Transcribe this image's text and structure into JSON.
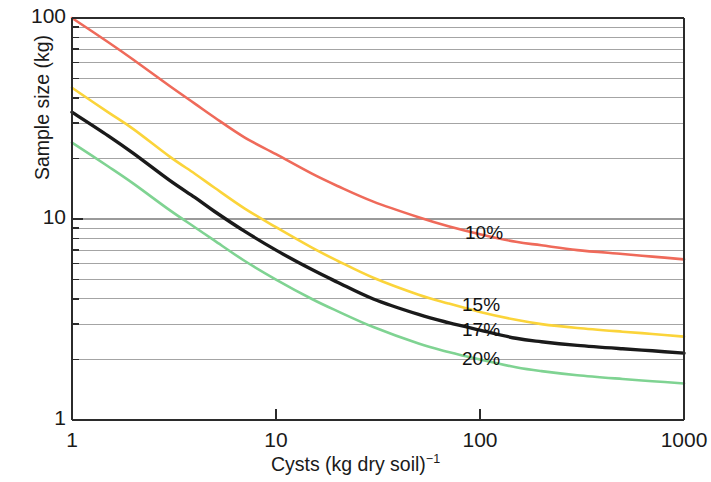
{
  "chart_data": {
    "type": "line",
    "title": "",
    "xlabel": "Cysts (kg dry soil)−1",
    "xlabel_base": "Cysts (kg dry soil)",
    "xlabel_exponent": "−1",
    "ylabel": "Sample size (kg)",
    "xscale": "log",
    "yscale": "log",
    "xlim": [
      1,
      1000
    ],
    "ylim": [
      1,
      100
    ],
    "xticks": [
      "1",
      "10",
      "100",
      "1000"
    ],
    "xtick_values": [
      1,
      10,
      100,
      1000
    ],
    "yticks": [
      "1",
      "10",
      "100"
    ],
    "ytick_values": [
      1,
      10,
      100
    ],
    "grid": "horizontal-minor-log",
    "legend_position": "inline-right",
    "series": [
      {
        "name": "10%",
        "color": "#ef6a5a",
        "width": 2.6,
        "label_x": 465,
        "label_y": 222,
        "x": [
          1,
          1.5,
          2,
          3,
          4,
          5,
          7,
          10,
          15,
          20,
          30,
          50,
          70,
          100,
          150,
          200,
          300,
          500,
          700,
          1000
        ],
        "y": [
          100,
          76,
          62,
          46,
          37.5,
          32,
          25.5,
          21,
          16.8,
          14.6,
          12.2,
          10.2,
          9.2,
          8.4,
          7.7,
          7.4,
          7.0,
          6.7,
          6.5,
          6.3
        ]
      },
      {
        "name": "15%",
        "color": "#fbd43a",
        "width": 2.6,
        "label_x": 462,
        "label_y": 294,
        "x": [
          1,
          1.5,
          2,
          3,
          4,
          5,
          7,
          10,
          15,
          20,
          30,
          50,
          70,
          100,
          150,
          200,
          300,
          500,
          700,
          1000
        ],
        "y": [
          45,
          34,
          28,
          20.5,
          16.8,
          14.3,
          11.3,
          9.1,
          7.2,
          6.2,
          5.1,
          4.2,
          3.8,
          3.45,
          3.15,
          3.0,
          2.87,
          2.75,
          2.68,
          2.6
        ]
      },
      {
        "name": "17%",
        "color": "#1a1a1a",
        "width": 3.4,
        "label_x": 462,
        "label_y": 319,
        "x": [
          1,
          1.5,
          2,
          3,
          4,
          5,
          7,
          10,
          15,
          20,
          30,
          50,
          70,
          100,
          150,
          200,
          300,
          500,
          700,
          1000
        ],
        "y": [
          34,
          26,
          21.2,
          15.6,
          12.8,
          10.9,
          8.7,
          7.0,
          5.6,
          4.85,
          4.0,
          3.35,
          3.05,
          2.8,
          2.55,
          2.45,
          2.35,
          2.26,
          2.21,
          2.15
        ]
      },
      {
        "name": "20%",
        "color": "#7fd392",
        "width": 2.6,
        "label_x": 462,
        "label_y": 348,
        "x": [
          1,
          1.5,
          2,
          3,
          4,
          5,
          7,
          10,
          15,
          20,
          30,
          50,
          70,
          100,
          150,
          200,
          300,
          500,
          700,
          1000
        ],
        "y": [
          24,
          18.3,
          15.0,
          11.1,
          9.1,
          7.8,
          6.2,
          5.0,
          4.0,
          3.48,
          2.9,
          2.4,
          2.18,
          2.0,
          1.83,
          1.75,
          1.67,
          1.6,
          1.56,
          1.52
        ]
      }
    ],
    "minor_gridline_multipliers": [
      2,
      3,
      4,
      5,
      6,
      7,
      8,
      9
    ],
    "gridline_color": "#9a9a9a",
    "axis_color": "#2b2b2b",
    "plot_area": {
      "left": 72,
      "top": 18,
      "right": 684,
      "bottom": 420
    }
  }
}
